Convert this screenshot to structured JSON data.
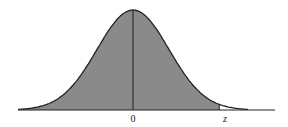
{
  "chart_data": {
    "type": "area",
    "title": "",
    "xlabel": "",
    "ylabel": "",
    "curve": "standard normal pdf",
    "x_range": [
      -3.2,
      3.2
    ],
    "shaded_region": {
      "from": "-inf",
      "to": "z"
    },
    "tick_labels": [
      {
        "label": "0",
        "x": 0
      },
      {
        "label": "z",
        "x": 2.4
      }
    ],
    "grid": false,
    "legend": null,
    "colors": {
      "fill": "#8a8a8a",
      "line": "#222222"
    }
  },
  "labels": {
    "zero": "0",
    "z": "z"
  }
}
